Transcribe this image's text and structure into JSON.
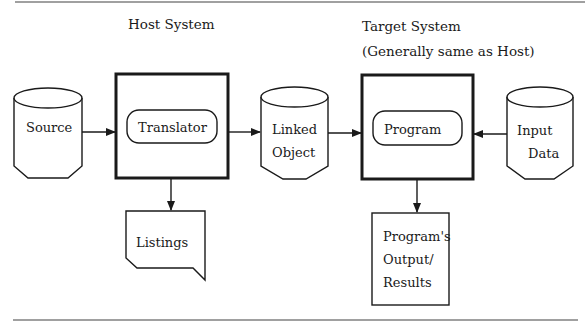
{
  "headings": {
    "host": "Host System",
    "target_line1": "Target System",
    "target_line2": "(Generally same as Host)"
  },
  "nodes": {
    "source": {
      "label": "Source",
      "shape": "cylinder"
    },
    "translator": {
      "label": "Translator",
      "shape": "rounded-process-in-box"
    },
    "linked_object": {
      "line1": "Linked",
      "line2": "Object",
      "shape": "cylinder"
    },
    "program": {
      "label": "Program",
      "shape": "rounded-process-in-box"
    },
    "input_data": {
      "line1": "Input",
      "line2": "Data",
      "shape": "cylinder"
    },
    "listings": {
      "label": "Listings",
      "shape": "document"
    },
    "output": {
      "line1": "Program's",
      "line2": "Output/",
      "line3": "Results",
      "shape": "box"
    }
  },
  "edges": [
    {
      "from": "source",
      "to": "translator"
    },
    {
      "from": "translator",
      "to": "linked_object"
    },
    {
      "from": "translator",
      "to": "listings"
    },
    {
      "from": "linked_object",
      "to": "program"
    },
    {
      "from": "input_data",
      "to": "program"
    },
    {
      "from": "program",
      "to": "output"
    }
  ],
  "colors": {
    "ink": "#1a1a1a",
    "rule": "#808080",
    "background": "#ffffff"
  }
}
